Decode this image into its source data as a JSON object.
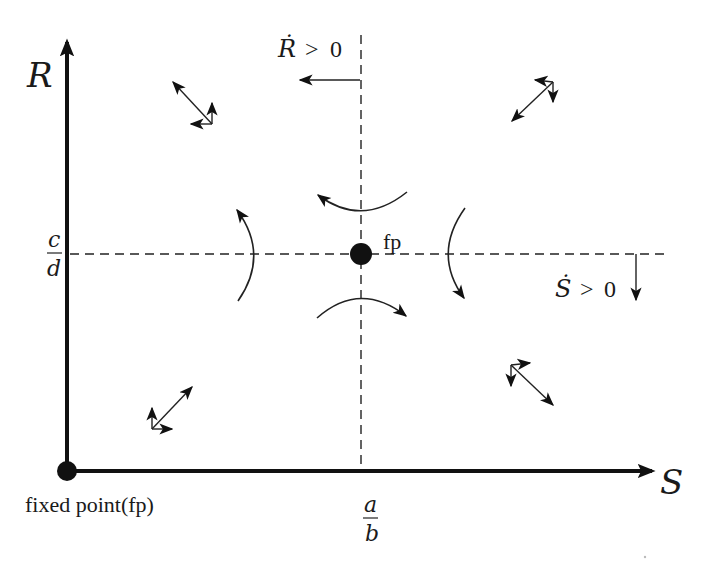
{
  "diagram": {
    "type": "phase-plane",
    "axes": {
      "y_label": "R",
      "x_label": "S"
    },
    "ticks": {
      "y_tick": {
        "numerator": "c",
        "denominator": "d"
      },
      "x_tick": {
        "numerator": "a",
        "denominator": "b"
      }
    },
    "nullclines": {
      "vertical": {
        "label_var": "Ṙ",
        "label_rel": ">",
        "label_val": "0",
        "arrow_direction": "left"
      },
      "horizontal": {
        "label_var": "Ṡ",
        "label_rel": ">",
        "label_val": "0",
        "arrow_direction": "down"
      }
    },
    "points": {
      "origin_label": "fixed point(fp)",
      "center_label": "fp"
    },
    "quadrant_vectors": [
      {
        "quadrant": "top-left",
        "direction": "up-left",
        "components": [
          "left",
          "up"
        ]
      },
      {
        "quadrant": "top-right",
        "direction": "down-left",
        "components": [
          "left",
          "down"
        ]
      },
      {
        "quadrant": "bottom-left",
        "direction": "up-right",
        "components": [
          "right",
          "up"
        ]
      },
      {
        "quadrant": "bottom-right",
        "direction": "down-right",
        "components": [
          "right",
          "down"
        ]
      }
    ],
    "saddle_trajectories": [
      {
        "position": "top",
        "direction": "counterclockwise-left"
      },
      {
        "position": "bottom",
        "direction": "clockwise-right"
      },
      {
        "position": "left",
        "direction": "upward"
      },
      {
        "position": "right",
        "direction": "downward"
      }
    ]
  }
}
